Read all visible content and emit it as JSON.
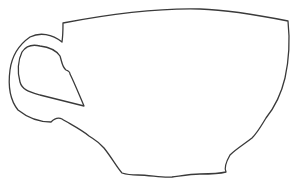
{
  "image": {
    "subject": "teacup outline",
    "description": "Single-line outline drawing of a teacup with a handle on the left, wide rim on top, and wavy bottom edge",
    "stroke_color": "#3a3a3a",
    "background_color": "#ffffff",
    "stroke_width": 1.3
  }
}
